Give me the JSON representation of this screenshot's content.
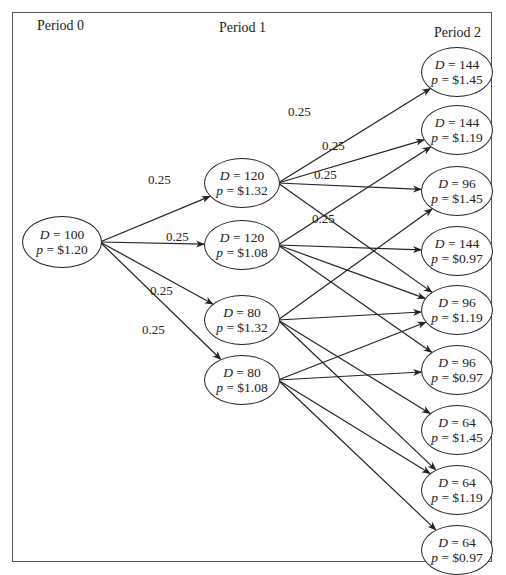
{
  "periods": [
    "Period 0",
    "Period 1",
    "Period 2"
  ],
  "nodes": {
    "p0": [
      {
        "D": "100",
        "p": "$1.20"
      }
    ],
    "p1": [
      {
        "D": "120",
        "p": "$1.32"
      },
      {
        "D": "120",
        "p": "$1.08"
      },
      {
        "D": "80",
        "p": "$1.32"
      },
      {
        "D": "80",
        "p": "$1.08"
      }
    ],
    "p2": [
      {
        "D": "144",
        "p": "$1.45"
      },
      {
        "D": "144",
        "p": "$1.19"
      },
      {
        "D": "96",
        "p": "$1.45"
      },
      {
        "D": "144",
        "p": "$0.97"
      },
      {
        "D": "96",
        "p": "$1.19"
      },
      {
        "D": "96",
        "p": "$0.97"
      },
      {
        "D": "64",
        "p": "$1.45"
      },
      {
        "D": "64",
        "p": "$1.19"
      },
      {
        "D": "64",
        "p": "$0.97"
      }
    ]
  },
  "edges_p0_p1": [
    {
      "from": 0,
      "to": 0,
      "prob": "0.25"
    },
    {
      "from": 0,
      "to": 1,
      "prob": "0.25"
    },
    {
      "from": 0,
      "to": 2,
      "prob": "0.25"
    },
    {
      "from": 0,
      "to": 3,
      "prob": "0.25"
    }
  ],
  "edges_p1_p2": [
    {
      "from": 0,
      "to": 0,
      "prob": "0.25"
    },
    {
      "from": 0,
      "to": 1,
      "prob": "0.25"
    },
    {
      "from": 0,
      "to": 2,
      "prob": "0.25"
    },
    {
      "from": 0,
      "to": 4,
      "prob": "0.25"
    },
    {
      "from": 1,
      "to": 1
    },
    {
      "from": 1,
      "to": 3
    },
    {
      "from": 1,
      "to": 4
    },
    {
      "from": 1,
      "to": 5
    },
    {
      "from": 2,
      "to": 2
    },
    {
      "from": 2,
      "to": 4
    },
    {
      "from": 2,
      "to": 6
    },
    {
      "from": 2,
      "to": 7
    },
    {
      "from": 3,
      "to": 4
    },
    {
      "from": 3,
      "to": 5
    },
    {
      "from": 3,
      "to": 7
    },
    {
      "from": 3,
      "to": 8
    }
  ],
  "labels": {
    "D": "D",
    "p": "p",
    "eq": " = "
  },
  "colors": {
    "line": "#222222",
    "frame": "#555555",
    "background": "#ffffff"
  }
}
